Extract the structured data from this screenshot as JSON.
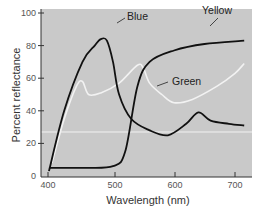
{
  "chart_data": {
    "type": "line",
    "title": "",
    "xlabel": "Wavelength (nm)",
    "ylabel": "Percent reflectance",
    "xlim": [
      390,
      720
    ],
    "ylim": [
      0,
      100
    ],
    "xticks": [
      400,
      500,
      600,
      700
    ],
    "yticks": [
      0,
      20,
      40,
      60,
      80,
      100
    ],
    "grid": false,
    "legend": "inline labels",
    "background": "#c9c9c9",
    "series": [
      {
        "name": "Blue",
        "color": "#111111",
        "x": [
          395,
          420,
          450,
          470,
          480,
          490,
          500,
          510,
          530,
          560,
          590,
          620,
          640,
          660,
          690,
          715
        ],
        "values": [
          3,
          40,
          70,
          80,
          84,
          83,
          70,
          50,
          35,
          28,
          25,
          32,
          39,
          34,
          32,
          31
        ]
      },
      {
        "name": "Green",
        "color": "#f2f2f2",
        "x": [
          400,
          420,
          440,
          450,
          460,
          480,
          510,
          540,
          550,
          560,
          580,
          600,
          630,
          670,
          700,
          715
        ],
        "values": [
          8,
          35,
          55,
          58,
          50,
          51,
          57,
          68,
          66,
          57,
          50,
          45,
          47,
          55,
          63,
          69
        ]
      },
      {
        "name": "Yellow",
        "color": "#111111",
        "x": [
          395,
          450,
          500,
          520,
          540,
          560,
          600,
          650,
          715
        ],
        "values": [
          5,
          5,
          6,
          15,
          55,
          70,
          77,
          81,
          83
        ]
      },
      {
        "name": "baseline",
        "color": "#f2f2f2",
        "x": [
          390,
          720
        ],
        "values": [
          27,
          27
        ]
      }
    ],
    "annotations": [
      {
        "text": "Blue",
        "x": 505,
        "y": 84
      },
      {
        "text": "Yellow",
        "x": 640,
        "y": 96
      },
      {
        "text": "Green",
        "x": 590,
        "y": 60
      }
    ]
  },
  "labels": {
    "xlabel": "Wavelength (nm)",
    "ylabel": "Percent reflectance",
    "xticks": [
      "400",
      "500",
      "600",
      "700"
    ],
    "yticks": [
      "0",
      "20",
      "40",
      "60",
      "80",
      "100"
    ],
    "blue": "Blue",
    "green": "Green",
    "yellow": "Yellow"
  }
}
